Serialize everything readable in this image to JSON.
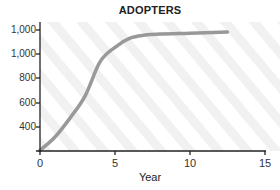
{
  "chart_data": {
    "type": "line",
    "title": "ADOPTERS",
    "xlabel": "Year",
    "ylabel": "",
    "xlim": [
      0,
      15
    ],
    "ylim": [
      200,
      1200
    ],
    "x_ticks": [
      "0",
      "5",
      "10",
      "15"
    ],
    "y_ticks": [
      "1,000",
      "1,000",
      "800",
      "600",
      "400"
    ],
    "grid": false,
    "legend": null,
    "series": [
      {
        "name": "Adopters",
        "color": "#999999",
        "x": [
          0,
          1,
          2,
          3,
          4,
          5,
          6,
          7,
          8,
          10,
          12.5
        ],
        "y": [
          205,
          315,
          470,
          650,
          930,
          1050,
          1125,
          1150,
          1158,
          1165,
          1175
        ]
      }
    ]
  },
  "colors": {
    "line": "#999999",
    "axis": "#222222",
    "stripe": "#f1f1f1"
  }
}
